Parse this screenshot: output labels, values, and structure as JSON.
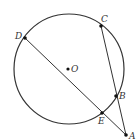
{
  "diagram": {
    "type": "circle-geometry",
    "circle": {
      "center_label": "O",
      "cx": 69,
      "cy": 69,
      "r": 55,
      "stroke": "#333333"
    },
    "points": [
      {
        "name": "D",
        "label": "D",
        "x": 25,
        "y": 38,
        "lx": 15,
        "ly": 39
      },
      {
        "name": "C",
        "label": "C",
        "x": 101,
        "y": 26,
        "lx": 101,
        "ly": 22
      },
      {
        "name": "O",
        "label": "O",
        "x": 68,
        "y": 69,
        "lx": 71,
        "ly": 72
      },
      {
        "name": "B",
        "label": "B",
        "x": 116,
        "y": 96,
        "lx": 119,
        "ly": 99
      },
      {
        "name": "E",
        "label": "E",
        "x": 102,
        "y": 113,
        "lx": 98,
        "ly": 124
      },
      {
        "name": "A",
        "label": "A",
        "x": 126,
        "y": 135,
        "lx": 129,
        "ly": 139
      }
    ],
    "segments": [
      {
        "from": "D",
        "to": "A",
        "through": "E"
      },
      {
        "from": "C",
        "to": "A",
        "through": "B"
      }
    ],
    "colors": {
      "stroke": "#333333",
      "point": "#111111",
      "label": "#333333"
    }
  }
}
